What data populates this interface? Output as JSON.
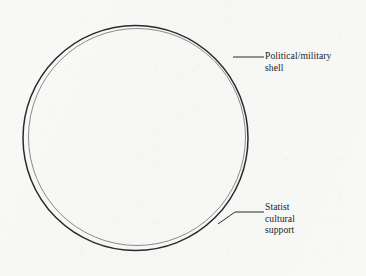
{
  "figure": {
    "type": "concentric-circle-diagram",
    "background_color": "#f8f8f7",
    "shapes": {
      "outer_ring": {
        "name": "political-military-shell-ring",
        "stroke_color": "#2a2a2a",
        "stroke_width": 1.5,
        "center": [
          135.5,
          138.0
        ],
        "radius": 112.5
      },
      "inner_ring": {
        "name": "statist-cultural-support-ring",
        "stroke_color": "#8a8a8a",
        "stroke_width": 1.0,
        "center": [
          137.0,
          137.0
        ],
        "radius": 108.5
      }
    },
    "leaders": [
      {
        "name": "shell-leader-line",
        "color": "#2a2a2a",
        "points": "233,57 264,57"
      },
      {
        "name": "support-leader-line",
        "color": "#2a2a2a",
        "points": "218,224 235,212 264,212"
      }
    ]
  },
  "labels": {
    "shell": {
      "name": "political-military-shell-label",
      "lines": [
        "Political/military",
        "shell"
      ]
    },
    "support": {
      "name": "statist-cultural-support-label",
      "lines": [
        "Statist",
        "cultural",
        "support"
      ]
    }
  }
}
